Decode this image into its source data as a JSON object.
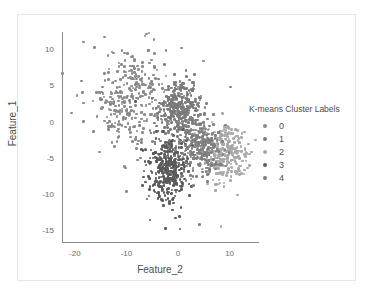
{
  "figure": {
    "background": "#ffffff",
    "frame_color": "#e6e6e6",
    "axis_color": "#8c8c8c"
  },
  "chart_data": {
    "type": "scatter",
    "title": "",
    "xlabel": "Feature_2",
    "ylabel": "Feature_1",
    "xlim": [
      -22.5,
      15.5
    ],
    "ylim": [
      -16.5,
      12.5
    ],
    "xticks": [
      -20,
      -10,
      0,
      10
    ],
    "yticks": [
      10,
      5,
      0,
      -5,
      -10,
      -15
    ],
    "xtick_labels": [
      "-20",
      "-10",
      "0",
      "10"
    ],
    "ytick_labels": [
      "10",
      "5",
      "0",
      "-5",
      "-10",
      "-15"
    ],
    "grid": false,
    "legend_position": "right",
    "legend_title": "K-means Cluster Labels",
    "marker_size": 2.6,
    "series": [
      {
        "name": "0",
        "label": "0",
        "color": "#8a8a8a",
        "n_points": 330,
        "center": [
          -9.5,
          3.8
        ],
        "spread": [
          3.6,
          3.4
        ],
        "description": "upper-left diffuse cluster, medium gray"
      },
      {
        "name": "1",
        "label": "1",
        "color": "#7a7a7a",
        "n_points": 300,
        "center": [
          0.2,
          2.0
        ],
        "spread": [
          1.9,
          1.9
        ],
        "description": "central-upper dense cluster, dark-medium gray"
      },
      {
        "name": "2",
        "label": "2",
        "color": "#a8a8a8",
        "n_points": 290,
        "center": [
          9.0,
          -4.2
        ],
        "spread": [
          2.2,
          1.8
        ],
        "description": "far-right cluster, lightest gray"
      },
      {
        "name": "3",
        "label": "3",
        "color": "#5a5a5a",
        "n_points": 360,
        "center": [
          -1.9,
          -6.4
        ],
        "spread": [
          1.9,
          2.3
        ],
        "description": "bottom cluster, darkest gray"
      },
      {
        "name": "4",
        "label": "4",
        "color": "#7f7f7f",
        "n_points": 300,
        "center": [
          4.0,
          -3.2
        ],
        "spread": [
          2.2,
          2.1
        ],
        "description": "mid-right cluster, medium-dark gray"
      }
    ],
    "legend_entries": [
      {
        "label": "0",
        "color": "#8a8a8a"
      },
      {
        "label": "1",
        "color": "#7a7a7a"
      },
      {
        "label": "2",
        "color": "#a8a8a8"
      },
      {
        "label": "3",
        "color": "#5a5a5a"
      },
      {
        "label": "4",
        "color": "#7f7f7f"
      }
    ]
  }
}
